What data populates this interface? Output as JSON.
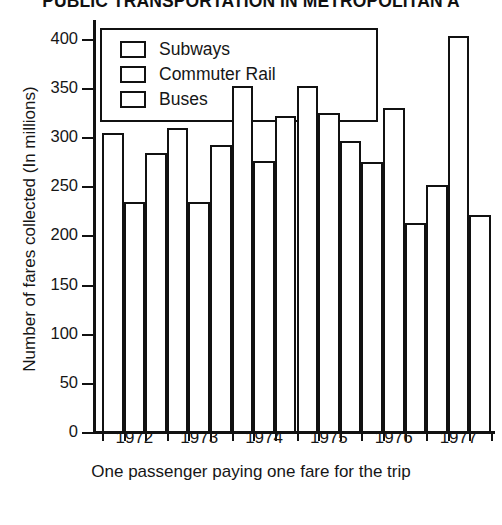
{
  "chart_data": {
    "type": "bar",
    "title": "PUBLIC TRANSPORTATION IN METROPOLITAN A",
    "xlabel": "One passenger paying one fare for the trip",
    "ylabel": "Number of fares collected (In millions)",
    "categories": [
      "1972",
      "1973",
      "1974",
      "1975",
      "1976",
      "1977"
    ],
    "series": [
      {
        "name": "Subways",
        "values": [
          305,
          310,
          353,
          353,
          276,
          252
        ]
      },
      {
        "name": "Commuter Rail",
        "values": [
          235,
          235,
          277,
          325,
          331,
          404
        ]
      },
      {
        "name": "Buses",
        "values": [
          285,
          293,
          322,
          297,
          214,
          222
        ]
      }
    ],
    "ylim": [
      0,
      420
    ],
    "yticks": [
      0,
      50,
      100,
      150,
      200,
      250,
      300,
      350,
      400
    ],
    "ytick_labels": [
      "0",
      "50",
      "100",
      "150",
      "200",
      "250",
      "300",
      "350",
      "400"
    ],
    "grid": false,
    "legend_position": "upper-left-inside",
    "bar_fill": "#ffffff",
    "bar_edge": "#111111"
  },
  "legend": {
    "items": [
      {
        "label": "Subways"
      },
      {
        "label": "Commuter Rail"
      },
      {
        "label": "Buses"
      }
    ]
  }
}
